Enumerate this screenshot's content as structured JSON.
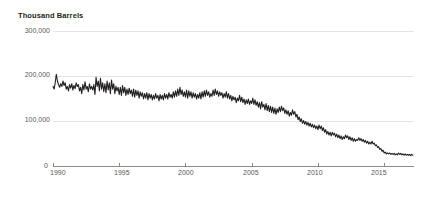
{
  "chart_data": {
    "type": "line",
    "title": "Thousand Barrels",
    "xlabel": "",
    "ylabel": "Thousand Barrels",
    "ylim": [
      0,
      300000
    ],
    "xlim": [
      1990,
      2017.25
    ],
    "grid": true,
    "legend": "none",
    "y_ticks": [
      "0",
      "100,000",
      "200,000",
      "300,000"
    ],
    "y_tick_values": [
      0,
      100000,
      200000,
      300000
    ],
    "x_ticks": [
      "1990",
      "1995",
      "2000",
      "2005",
      "2010",
      "2015"
    ],
    "x_tick_values": [
      1990,
      1995,
      2000,
      2005,
      2010,
      2015
    ],
    "line_color": "#231f20",
    "grid_color": "#e3e3e5",
    "series": [
      {
        "name": "Thousand Barrels",
        "x": [
          1990.0,
          1990.083,
          1990.167,
          1990.25,
          1990.333,
          1990.417,
          1990.5,
          1990.583,
          1990.667,
          1990.75,
          1990.833,
          1990.917,
          1991.0,
          1991.083,
          1991.167,
          1991.25,
          1991.333,
          1991.417,
          1991.5,
          1991.583,
          1991.667,
          1991.75,
          1991.833,
          1991.917,
          1992.0,
          1992.083,
          1992.167,
          1992.25,
          1992.333,
          1992.417,
          1992.5,
          1992.583,
          1992.667,
          1992.75,
          1992.833,
          1992.917,
          1993.0,
          1993.083,
          1993.167,
          1993.25,
          1993.333,
          1993.417,
          1993.5,
          1993.583,
          1993.667,
          1993.75,
          1993.833,
          1993.917,
          1994.0,
          1994.083,
          1994.167,
          1994.25,
          1994.333,
          1994.417,
          1994.5,
          1994.583,
          1994.667,
          1994.75,
          1994.833,
          1994.917,
          1995.0,
          1995.083,
          1995.167,
          1995.25,
          1995.333,
          1995.417,
          1995.5,
          1995.583,
          1995.667,
          1995.75,
          1995.833,
          1995.917,
          1996.0,
          1996.083,
          1996.167,
          1996.25,
          1996.333,
          1996.417,
          1996.5,
          1996.583,
          1996.667,
          1996.75,
          1996.833,
          1996.917,
          1997.0,
          1997.083,
          1997.167,
          1997.25,
          1997.333,
          1997.417,
          1997.5,
          1997.583,
          1997.667,
          1997.75,
          1997.833,
          1997.917,
          1998.0,
          1998.083,
          1998.167,
          1998.25,
          1998.333,
          1998.417,
          1998.5,
          1998.583,
          1998.667,
          1998.75,
          1998.833,
          1998.917,
          1999.0,
          1999.083,
          1999.167,
          1999.25,
          1999.333,
          1999.417,
          1999.5,
          1999.583,
          1999.667,
          1999.75,
          1999.833,
          1999.917,
          2000.0,
          2000.083,
          2000.167,
          2000.25,
          2000.333,
          2000.417,
          2000.5,
          2000.583,
          2000.667,
          2000.75,
          2000.833,
          2000.917,
          2001.0,
          2001.083,
          2001.167,
          2001.25,
          2001.333,
          2001.417,
          2001.5,
          2001.583,
          2001.667,
          2001.75,
          2001.833,
          2001.917,
          2002.0,
          2002.083,
          2002.167,
          2002.25,
          2002.333,
          2002.417,
          2002.5,
          2002.583,
          2002.667,
          2002.75,
          2002.833,
          2002.917,
          2003.0,
          2003.083,
          2003.167,
          2003.25,
          2003.333,
          2003.417,
          2003.5,
          2003.583,
          2003.667,
          2003.75,
          2003.833,
          2003.917,
          2004.0,
          2004.083,
          2004.167,
          2004.25,
          2004.333,
          2004.417,
          2004.5,
          2004.583,
          2004.667,
          2004.75,
          2004.833,
          2004.917,
          2005.0,
          2005.083,
          2005.167,
          2005.25,
          2005.333,
          2005.417,
          2005.5,
          2005.583,
          2005.667,
          2005.75,
          2005.833,
          2005.917,
          2006.0,
          2006.083,
          2006.167,
          2006.25,
          2006.333,
          2006.417,
          2006.5,
          2006.583,
          2006.667,
          2006.75,
          2006.833,
          2006.917,
          2007.0,
          2007.083,
          2007.167,
          2007.25,
          2007.333,
          2007.417,
          2007.5,
          2007.583,
          2007.667,
          2007.75,
          2007.833,
          2007.917,
          2008.0,
          2008.083,
          2008.167,
          2008.25,
          2008.333,
          2008.417,
          2008.5,
          2008.583,
          2008.667,
          2008.75,
          2008.833,
          2008.917,
          2009.0,
          2009.083,
          2009.167,
          2009.25,
          2009.333,
          2009.417,
          2009.5,
          2009.583,
          2009.667,
          2009.75,
          2009.833,
          2009.917,
          2010.0,
          2010.083,
          2010.167,
          2010.25,
          2010.333,
          2010.417,
          2010.5,
          2010.583,
          2010.667,
          2010.75,
          2010.833,
          2010.917,
          2011.0,
          2011.083,
          2011.167,
          2011.25,
          2011.333,
          2011.417,
          2011.5,
          2011.583,
          2011.667,
          2011.75,
          2011.833,
          2011.917,
          2012.0,
          2012.083,
          2012.167,
          2012.25,
          2012.333,
          2012.417,
          2012.5,
          2012.583,
          2012.667,
          2012.75,
          2012.833,
          2012.917,
          2013.0,
          2013.083,
          2013.167,
          2013.25,
          2013.333,
          2013.417,
          2013.5,
          2013.583,
          2013.667,
          2013.75,
          2013.833,
          2013.917,
          2014.0,
          2014.083,
          2014.167,
          2014.25,
          2014.333,
          2014.417,
          2014.5,
          2014.583,
          2014.667,
          2014.75,
          2014.833,
          2014.917,
          2015.0,
          2015.083,
          2015.167,
          2015.25,
          2015.333,
          2015.417,
          2015.5,
          2015.583,
          2015.667,
          2015.75,
          2015.833,
          2015.917,
          2016.0,
          2016.083,
          2016.167,
          2016.25,
          2016.333,
          2016.417,
          2016.5,
          2016.583,
          2016.667,
          2016.75,
          2016.833,
          2016.917,
          2017.0,
          2017.083,
          2017.167
        ],
        "values": [
          178000,
          172000,
          186000,
          205000,
          190000,
          182000,
          176000,
          184000,
          178000,
          190000,
          180000,
          186000,
          172000,
          178000,
          168000,
          182000,
          174000,
          184000,
          170000,
          180000,
          173000,
          186000,
          178000,
          182000,
          168000,
          176000,
          162000,
          182000,
          170000,
          188000,
          172000,
          178000,
          166000,
          184000,
          172000,
          178000,
          170000,
          182000,
          160000,
          198000,
          178000,
          190000,
          168000,
          196000,
          172000,
          186000,
          166000,
          184000,
          164000,
          190000,
          170000,
          186000,
          162000,
          192000,
          172000,
          184000,
          162000,
          178000,
          168000,
          176000,
          160000,
          176000,
          158000,
          180000,
          164000,
          176000,
          158000,
          172000,
          160000,
          174000,
          162000,
          170000,
          156000,
          172000,
          154000,
          170000,
          158000,
          168000,
          152000,
          166000,
          156000,
          164000,
          150000,
          162000,
          152000,
          164000,
          148000,
          162000,
          152000,
          160000,
          148000,
          158000,
          150000,
          162000,
          152000,
          158000,
          146000,
          160000,
          150000,
          158000,
          148000,
          162000,
          152000,
          160000,
          150000,
          164000,
          154000,
          160000,
          152000,
          166000,
          154000,
          168000,
          156000,
          172000,
          158000,
          176000,
          160000,
          170000,
          156000,
          166000,
          154000,
          170000,
          152000,
          168000,
          156000,
          166000,
          152000,
          164000,
          154000,
          162000,
          150000,
          160000,
          152000,
          164000,
          150000,
          166000,
          154000,
          168000,
          156000,
          170000,
          158000,
          166000,
          154000,
          162000,
          156000,
          170000,
          158000,
          172000,
          160000,
          168000,
          156000,
          166000,
          158000,
          164000,
          152000,
          162000,
          154000,
          166000,
          152000,
          162000,
          150000,
          158000,
          146000,
          156000,
          148000,
          154000,
          142000,
          152000,
          146000,
          158000,
          144000,
          154000,
          142000,
          150000,
          138000,
          148000,
          140000,
          150000,
          138000,
          146000,
          140000,
          152000,
          138000,
          148000,
          136000,
          144000,
          132000,
          142000,
          128000,
          144000,
          132000,
          138000,
          126000,
          140000,
          124000,
          136000,
          122000,
          134000,
          120000,
          132000,
          118000,
          130000,
          116000,
          128000,
          120000,
          132000,
          122000,
          134000,
          124000,
          130000,
          118000,
          126000,
          116000,
          124000,
          112000,
          120000,
          114000,
          126000,
          116000,
          122000,
          110000,
          116000,
          104000,
          110000,
          100000,
          106000,
          96000,
          102000,
          94000,
          100000,
          92000,
          98000,
          90000,
          96000,
          88000,
          94000,
          86000,
          92000,
          84000,
          90000,
          82000,
          92000,
          84000,
          90000,
          80000,
          86000,
          76000,
          82000,
          72000,
          78000,
          70000,
          76000,
          68000,
          76000,
          70000,
          74000,
          66000,
          72000,
          64000,
          70000,
          62000,
          68000,
          60000,
          66000,
          62000,
          70000,
          64000,
          68000,
          60000,
          66000,
          58000,
          64000,
          56000,
          62000,
          56000,
          60000,
          58000,
          64000,
          58000,
          62000,
          56000,
          60000,
          54000,
          58000,
          52000,
          56000,
          50000,
          54000,
          50000,
          56000,
          50000,
          52000,
          46000,
          48000,
          42000,
          44000,
          38000,
          40000,
          34000,
          36000,
          30000,
          32000,
          28000,
          30000,
          28000,
          30000,
          27000,
          29000,
          27000,
          29000,
          26000,
          28000,
          26000,
          30000,
          27000,
          29000,
          26000,
          28000,
          25000,
          28000,
          25000,
          27000,
          25000,
          27000,
          24000,
          27000,
          25000
        ]
      }
    ]
  }
}
